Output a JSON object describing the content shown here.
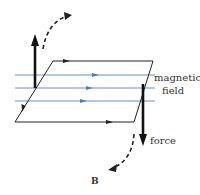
{
  "diagram": {
    "caption": "B",
    "labels": {
      "field_line1": "magnetic",
      "field_line2": "field",
      "force": "force"
    },
    "colors": {
      "field_lines": "#5b8ab5",
      "loop": "#222222",
      "force_arrow": "#111111",
      "text": "#333333"
    },
    "loop": {
      "shape": "parallelogram",
      "corners": [
        [
          53,
          61
        ],
        [
          153,
          61
        ],
        [
          134,
          122
        ],
        [
          15,
          122
        ]
      ],
      "current_direction": [
        "top edge: right-to-left",
        "left edge: downward",
        "bottom edge: left-to-right",
        "right edge: upward"
      ]
    },
    "field_lines": [
      {
        "y": 75,
        "direction": "right"
      },
      {
        "y": 88,
        "direction": "right"
      },
      {
        "y": 101,
        "direction": "right"
      }
    ],
    "forces": [
      {
        "side": "left",
        "direction": "up"
      },
      {
        "side": "right",
        "direction": "down"
      }
    ],
    "rotation_arrows": [
      {
        "position": "top-left",
        "style": "dashed",
        "direction": "clockwise-up"
      },
      {
        "position": "bottom-right",
        "style": "dashed",
        "direction": "clockwise-down"
      }
    ]
  }
}
